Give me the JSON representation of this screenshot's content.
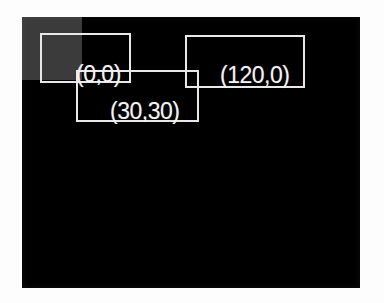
{
  "figure": {
    "background_color": "#fdfdfd",
    "canvas_color": "#000000",
    "annotation_color": "#e8e8e8",
    "patch_color": "#3b3b3b"
  },
  "canvas": {
    "name": "image-canvas",
    "width": 338,
    "height": 271
  },
  "regions": [
    {
      "name": "gray-patch",
      "x": 0,
      "y": 0,
      "width": 60,
      "height": 63,
      "color": "#3b3b3b"
    }
  ],
  "boxes": [
    {
      "name": "bounding-box-origin",
      "label": "(0,0)",
      "x": 18,
      "y": 16,
      "width": 91,
      "height": 50
    },
    {
      "name": "bounding-box-right",
      "label": "(120,0)",
      "x": 163,
      "y": 18,
      "width": 120,
      "height": 53
    },
    {
      "name": "bounding-box-inner",
      "label": "(30,30)",
      "x": 54,
      "y": 53,
      "width": 123,
      "height": 52
    }
  ],
  "labels": {
    "origin": "(0,0)",
    "right": "(120,0)",
    "inner": "(30,30)"
  }
}
